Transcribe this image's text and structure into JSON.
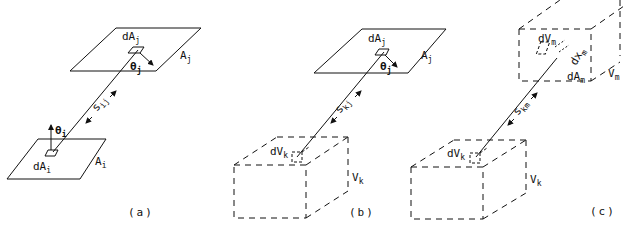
{
  "figure": {
    "panels": [
      {
        "id": "a",
        "caption": "(a)",
        "labels": {
          "dAj": {
            "base": "dA",
            "sub": "j"
          },
          "Aj": {
            "base": "A",
            "sub": "j"
          },
          "theta_j": {
            "base": "θ",
            "sub": "j"
          },
          "s_ij": {
            "base": "s",
            "sub": "ij"
          },
          "theta_i": {
            "base": "θ",
            "sub": "i"
          },
          "dAi": {
            "base": "dA",
            "sub": "i"
          },
          "Ai": {
            "base": "A",
            "sub": "i"
          }
        }
      },
      {
        "id": "b",
        "caption": "(b)",
        "labels": {
          "dAj": {
            "base": "dA",
            "sub": "j"
          },
          "Aj": {
            "base": "A",
            "sub": "j"
          },
          "theta_j": {
            "base": "θ",
            "sub": "j"
          },
          "s_kj": {
            "base": "s",
            "sub": "kj"
          },
          "dVk": {
            "base": "dV",
            "sub": "k"
          },
          "Vk": {
            "base": "V",
            "sub": "k"
          }
        }
      },
      {
        "id": "c",
        "caption": "(c)",
        "labels": {
          "dVm": {
            "base": "dV",
            "sub": "m"
          },
          "dxm": {
            "base": "dx",
            "sub": "m"
          },
          "dAm": {
            "base": "dA",
            "sub": "m"
          },
          "Vm": {
            "base": "V",
            "sub": "m"
          },
          "s_km": {
            "base": "s",
            "sub": "km"
          },
          "dVk": {
            "base": "dV",
            "sub": "k"
          },
          "Vk": {
            "base": "V",
            "sub": "k"
          }
        }
      }
    ]
  }
}
